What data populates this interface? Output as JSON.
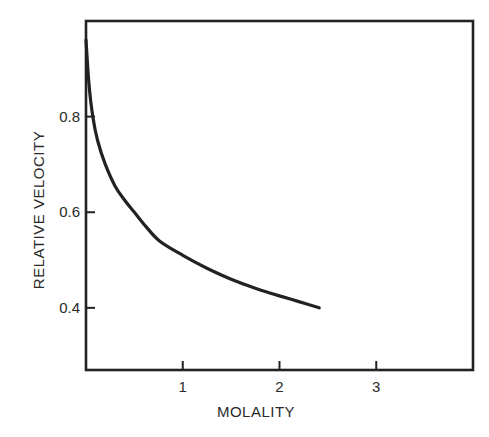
{
  "chart_data": {
    "type": "line",
    "title": "",
    "xlabel": "MOLALITY",
    "ylabel": "RELATIVE VELOCITY",
    "xlim": [
      0,
      4.0
    ],
    "ylim": [
      0.27,
      1.0
    ],
    "x_ticks": [
      1,
      2,
      3
    ],
    "x_tick_labels": [
      "1",
      "2",
      "3"
    ],
    "y_ticks": [
      0.4,
      0.6,
      0.8
    ],
    "y_tick_labels": [
      "0.4",
      "0.6",
      "0.8"
    ],
    "grid": false,
    "legend": null,
    "series": [
      {
        "name": "relative velocity",
        "x": [
          0.0,
          0.03,
          0.07,
          0.12,
          0.2,
          0.3,
          0.4,
          0.5,
          0.62,
          0.76,
          1.0,
          1.25,
          1.5,
          1.75,
          2.0,
          2.2,
          2.41
        ],
        "y": [
          0.96,
          0.87,
          0.8,
          0.75,
          0.7,
          0.655,
          0.625,
          0.6,
          0.57,
          0.54,
          0.51,
          0.483,
          0.46,
          0.441,
          0.425,
          0.413,
          0.4
        ]
      }
    ]
  }
}
